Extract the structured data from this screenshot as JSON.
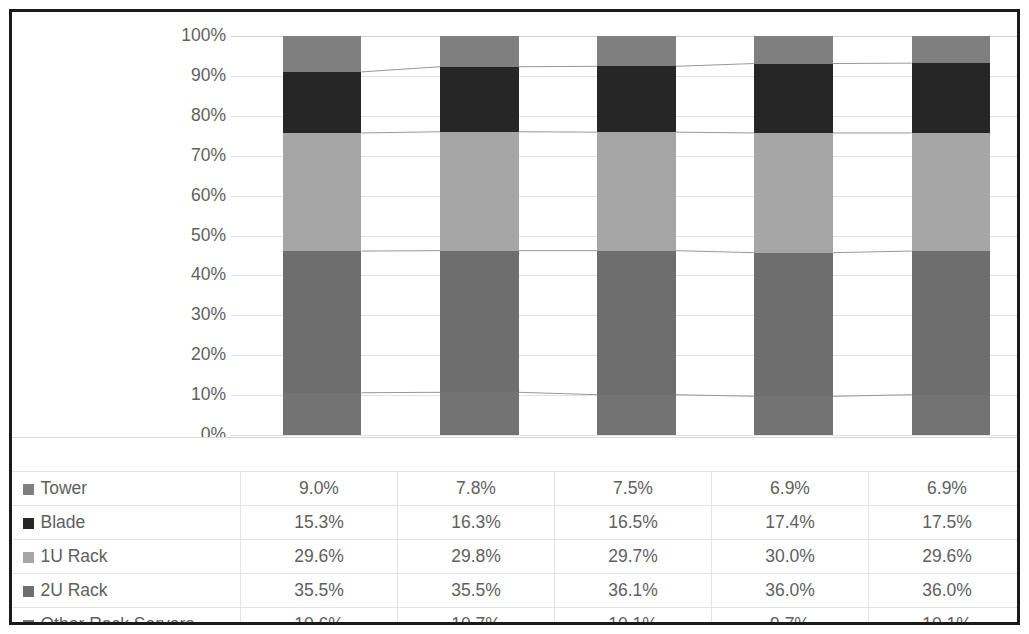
{
  "chart_data": {
    "type": "bar",
    "stacked": true,
    "stack_mode": "percent",
    "title": "",
    "xlabel": "",
    "ylabel": "",
    "categories": [
      "2014",
      "2015",
      "2016",
      "2017",
      "2018"
    ],
    "ylim": [
      0,
      100
    ],
    "ytick_labels": [
      "100%",
      "90%",
      "80%",
      "70%",
      "60%",
      "50%",
      "40%",
      "30%",
      "20%",
      "10%",
      "0%"
    ],
    "ytick_values": [
      100,
      90,
      80,
      70,
      60,
      50,
      40,
      30,
      20,
      10,
      0
    ],
    "grid": true,
    "legend_position": "data-table-left",
    "has_data_table": true,
    "has_series_connector_lines": true,
    "stack_order_bottom_to_top": [
      "Other Rack Servers",
      "2U Rack",
      "1U Rack",
      "Blade",
      "Tower"
    ],
    "series": [
      {
        "name": "Tower",
        "color": "#7f7f7f",
        "values": [
          9.0,
          7.8,
          7.5,
          6.9,
          6.9
        ],
        "labels": [
          "9.0%",
          "7.8%",
          "7.5%",
          "6.9%",
          "6.9%"
        ]
      },
      {
        "name": "Blade",
        "color": "#262626",
        "values": [
          15.3,
          16.3,
          16.5,
          17.4,
          17.5
        ],
        "labels": [
          "15.3%",
          "16.3%",
          "16.5%",
          "17.4%",
          "17.5%"
        ]
      },
      {
        "name": "1U Rack",
        "color": "#a6a6a6",
        "values": [
          29.6,
          29.8,
          29.7,
          30.0,
          29.6
        ],
        "labels": [
          "29.6%",
          "29.8%",
          "29.7%",
          "30.0%",
          "29.6%"
        ]
      },
      {
        "name": "2U Rack",
        "color": "#6e6e6e",
        "values": [
          35.5,
          35.5,
          36.1,
          36.0,
          36.0
        ],
        "labels": [
          "35.5%",
          "35.5%",
          "36.1%",
          "36.0%",
          "36.0%"
        ]
      },
      {
        "name": "Other Rack Servers",
        "color": "#737373",
        "values": [
          10.6,
          10.7,
          10.1,
          9.7,
          10.1
        ],
        "labels": [
          "10.6%",
          "10.7%",
          "10.1%",
          "9.7%",
          "10.1%"
        ]
      }
    ]
  },
  "table": {
    "header_row": [
      "",
      "2014",
      "2015",
      "2016",
      "2017",
      "2018"
    ],
    "rows": [
      {
        "label": "Tower",
        "swatch": "#7f7f7f",
        "values": [
          "9.0%",
          "7.8%",
          "7.5%",
          "6.9%",
          "6.9%"
        ]
      },
      {
        "label": "Blade",
        "swatch": "#262626",
        "values": [
          "15.3%",
          "16.3%",
          "16.5%",
          "17.4%",
          "17.5%"
        ]
      },
      {
        "label": "1U Rack",
        "swatch": "#a6a6a6",
        "values": [
          "29.6%",
          "29.8%",
          "29.7%",
          "30.0%",
          "29.6%"
        ]
      },
      {
        "label": "2U Rack",
        "swatch": "#6e6e6e",
        "values": [
          "35.5%",
          "35.5%",
          "36.1%",
          "36.0%",
          "36.0%"
        ]
      },
      {
        "label": "Other Rack Servers",
        "swatch": "#737373",
        "values": [
          "10.6%",
          "10.7%",
          "10.1%",
          "9.7%",
          "10.1%"
        ]
      }
    ]
  },
  "style": {
    "border_color": "#1a1a1a",
    "grid_color": "#e2e2e2",
    "text_color": "#5f5f5f",
    "connector_color": "#8c8c8c",
    "background": "#ffffff"
  }
}
